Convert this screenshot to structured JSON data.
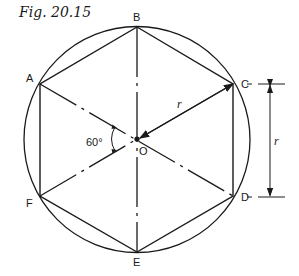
{
  "figure": {
    "title": "Fig. 20.15"
  },
  "diagram": {
    "type": "geometry",
    "center": {
      "label": "O",
      "x": 137,
      "y": 139
    },
    "circle_radius": 113,
    "vertices": [
      {
        "label": "A",
        "x": 40,
        "y": 84
      },
      {
        "label": "B",
        "x": 137,
        "y": 27
      },
      {
        "label": "C",
        "x": 233,
        "y": 84
      },
      {
        "label": "D",
        "x": 233,
        "y": 196
      },
      {
        "label": "E",
        "x": 137,
        "y": 252
      },
      {
        "label": "F",
        "x": 40,
        "y": 196
      }
    ],
    "angle_label": "60°",
    "radius_label": "r",
    "dimension_label": "r",
    "colors": {
      "stroke": "#1a1a1a",
      "background": "#ffffff"
    }
  }
}
